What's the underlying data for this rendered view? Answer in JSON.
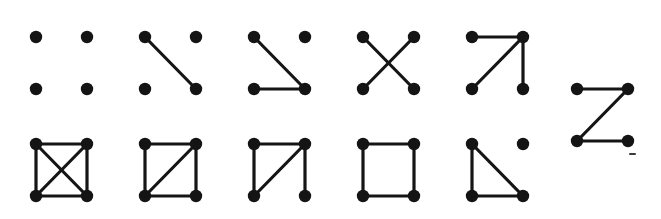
{
  "figure": {
    "vertex_color": "#141414",
    "edge_color": "#151515",
    "background_color": "#ffffff",
    "vertex_radius": 6.2,
    "edge_width": 3.2,
    "node_positions": {
      "tl": [
        0,
        0
      ],
      "tr": [
        51,
        0
      ],
      "bl": [
        0,
        52
      ],
      "br": [
        51,
        52
      ]
    },
    "node_labels": {
      "tl": "top-left",
      "tr": "top-right",
      "bl": "bottom-left",
      "br": "bottom-right"
    },
    "graphs": [
      {
        "id": "graph-1",
        "name": "empty-graph",
        "row": 0,
        "column": 0,
        "origin": [
          36,
          37
        ],
        "vertices": [
          "tl",
          "tr",
          "bl",
          "br"
        ],
        "edges": [],
        "edge_count": 0
      },
      {
        "id": "graph-2",
        "name": "single-edge",
        "row": 0,
        "column": 1,
        "origin": [
          145,
          37
        ],
        "vertices": [
          "tl",
          "tr",
          "bl",
          "br"
        ],
        "edges": [
          [
            "tl",
            "br"
          ]
        ],
        "edge_count": 1
      },
      {
        "id": "graph-3",
        "name": "path-p3-plus-isolated-vertex",
        "row": 0,
        "column": 2,
        "origin": [
          254,
          37
        ],
        "vertices": [
          "tl",
          "tr",
          "bl",
          "br"
        ],
        "edges": [
          [
            "tl",
            "br"
          ],
          [
            "bl",
            "br"
          ]
        ],
        "edge_count": 2
      },
      {
        "id": "graph-4",
        "name": "perfect-matching",
        "row": 0,
        "column": 3,
        "origin": [
          363,
          37
        ],
        "vertices": [
          "tl",
          "tr",
          "bl",
          "br"
        ],
        "edges": [
          [
            "tl",
            "br"
          ],
          [
            "tr",
            "bl"
          ]
        ],
        "edge_count": 2
      },
      {
        "id": "graph-5",
        "name": "star-k13",
        "row": 0,
        "column": 4,
        "origin": [
          472,
          37
        ],
        "vertices": [
          "tl",
          "tr",
          "bl",
          "br"
        ],
        "edges": [
          [
            "tl",
            "tr"
          ],
          [
            "tr",
            "bl"
          ],
          [
            "tr",
            "br"
          ]
        ],
        "edge_count": 3
      },
      {
        "id": "graph-6",
        "name": "path-p4",
        "row": 0,
        "column": 5,
        "origin": [
          577,
          89
        ],
        "vertices": [
          "tl",
          "tr",
          "bl",
          "br"
        ],
        "edges": [
          [
            "tl",
            "tr"
          ],
          [
            "tr",
            "bl"
          ],
          [
            "bl",
            "br"
          ]
        ],
        "edge_count": 3
      },
      {
        "id": "graph-7",
        "name": "complete-graph-k4",
        "row": 1,
        "column": 0,
        "origin": [
          36,
          144
        ],
        "vertices": [
          "tl",
          "tr",
          "bl",
          "br"
        ],
        "edges": [
          [
            "tl",
            "tr"
          ],
          [
            "tl",
            "bl"
          ],
          [
            "tr",
            "br"
          ],
          [
            "bl",
            "br"
          ],
          [
            "tl",
            "br"
          ],
          [
            "tr",
            "bl"
          ]
        ],
        "edge_count": 6
      },
      {
        "id": "graph-8",
        "name": "k4-minus-one-edge",
        "row": 1,
        "column": 1,
        "origin": [
          145,
          144
        ],
        "vertices": [
          "tl",
          "tr",
          "bl",
          "br"
        ],
        "edges": [
          [
            "tl",
            "tr"
          ],
          [
            "tl",
            "bl"
          ],
          [
            "tr",
            "br"
          ],
          [
            "bl",
            "br"
          ],
          [
            "bl",
            "tr"
          ]
        ],
        "edge_count": 5
      },
      {
        "id": "graph-9",
        "name": "triangle-with-pendant",
        "row": 1,
        "column": 2,
        "origin": [
          254,
          144
        ],
        "vertices": [
          "tl",
          "tr",
          "bl",
          "br"
        ],
        "edges": [
          [
            "tl",
            "tr"
          ],
          [
            "tl",
            "bl"
          ],
          [
            "bl",
            "tr"
          ],
          [
            "tr",
            "br"
          ]
        ],
        "edge_count": 4
      },
      {
        "id": "graph-10",
        "name": "cycle-c4",
        "row": 1,
        "column": 3,
        "origin": [
          363,
          144
        ],
        "vertices": [
          "tl",
          "tr",
          "bl",
          "br"
        ],
        "edges": [
          [
            "tl",
            "tr"
          ],
          [
            "tl",
            "bl"
          ],
          [
            "tr",
            "br"
          ],
          [
            "bl",
            "br"
          ]
        ],
        "edge_count": 4
      },
      {
        "id": "graph-11",
        "name": "triangle-plus-isolated-vertex",
        "row": 1,
        "column": 4,
        "origin": [
          472,
          144
        ],
        "vertices": [
          "tl",
          "tr",
          "bl",
          "br"
        ],
        "edges": [
          [
            "tl",
            "bl"
          ],
          [
            "tl",
            "br"
          ],
          [
            "bl",
            "br"
          ]
        ],
        "edge_count": 3
      }
    ],
    "marks": [
      {
        "id": "speck-1",
        "name": "scan-speck",
        "x": 629,
        "y": 153,
        "width": 7,
        "height": 2
      }
    ]
  }
}
